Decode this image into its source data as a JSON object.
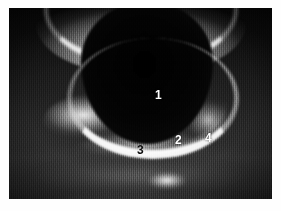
{
  "figure": {
    "kind": "ultrasound-image",
    "modality": "grayscale B-mode ultrasound",
    "background_color": "#ffffff",
    "frame": {
      "left": 9,
      "top": 8,
      "width": 263,
      "height": 191,
      "border_color": "#000000"
    }
  },
  "annotations": [
    {
      "id": "label-1",
      "text": "1",
      "color": "#ffffff",
      "x": 146,
      "y": 81,
      "region": "anechoic-lumen"
    },
    {
      "id": "label-2",
      "text": "2",
      "color": "#ffffff",
      "x": 166,
      "y": 126,
      "region": "posterior-wall"
    },
    {
      "id": "label-3",
      "text": "3",
      "color": "#0b0b0b",
      "x": 128,
      "y": 136,
      "region": "echogenic-structure"
    },
    {
      "id": "label-4",
      "text": "4",
      "color": "#ffffff",
      "x": 196,
      "y": 124,
      "region": "lateral-tissue"
    }
  ],
  "image_features": {
    "nearfield_band": "bright curved anterior wall across upper frame",
    "lumen": "large dark anechoic oval in upper-center",
    "posterior_arc": "bright crescent echo beneath the lumen",
    "deep_tissue": "speckled mid-gray tissue in lower third",
    "focal_blob": "bright focal echo low-center"
  }
}
